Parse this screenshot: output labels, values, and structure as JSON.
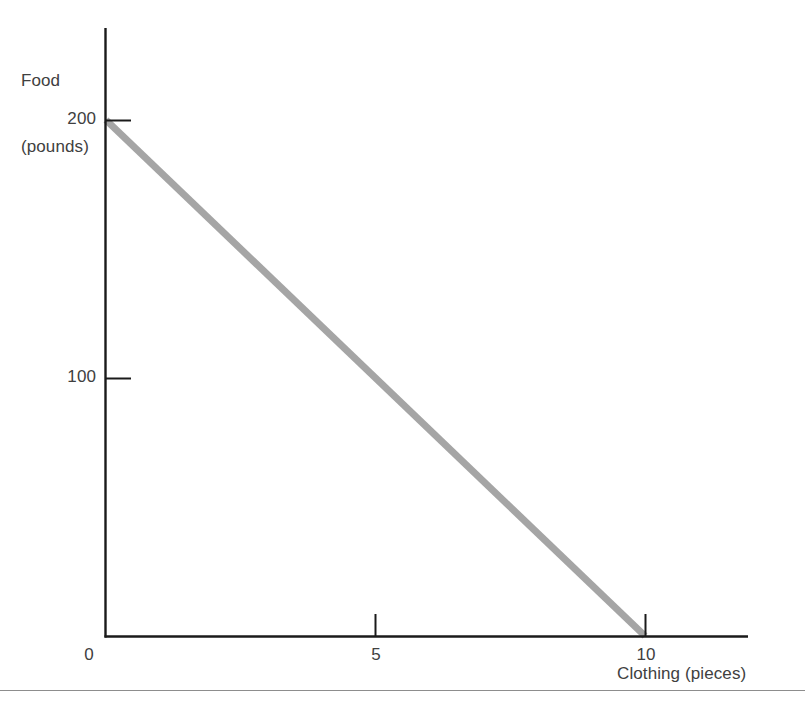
{
  "figure": {
    "background_color": "#ffffff",
    "axis_color": "#1a1a1a",
    "text_color": "#404040",
    "rule_color": "#8d8d8d"
  },
  "chart_data": {
    "type": "line",
    "title": "",
    "subtitle": "",
    "xlabel": "Clothing (pieces)",
    "ylabel": "Food\n(pounds)",
    "ylabel_line1": "Food",
    "ylabel_line2": "(pounds)",
    "xlim": [
      0,
      13.8
    ],
    "ylim": [
      0,
      236
    ],
    "xticks": [
      0,
      5,
      10
    ],
    "xticklabels": [
      "0",
      "5",
      "10"
    ],
    "yticks": [
      100,
      200
    ],
    "yticklabels": [
      "100",
      "200"
    ],
    "grid": false,
    "legend": null,
    "annotations": [],
    "series": [
      {
        "name": "Production possibilities frontier",
        "color": "#a5a5a5",
        "linewidth": 7,
        "x": [
          0,
          10
        ],
        "y": [
          200,
          0
        ],
        "points": [
          {
            "x": 0,
            "y": 200
          },
          {
            "x": 10,
            "y": 0
          }
        ]
      }
    ]
  },
  "labels": {
    "y_axis_title_line1": "Food",
    "y_axis_title_line2": "(pounds)",
    "x_axis_title": "Clothing (pieces)",
    "y_tick_200": "200",
    "y_tick_100": "100",
    "x_tick_0": "0",
    "x_tick_5": "5",
    "x_tick_10": "10"
  }
}
